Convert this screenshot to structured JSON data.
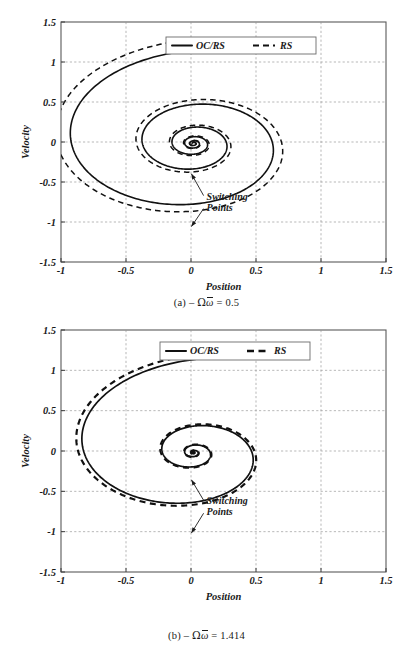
{
  "figure": {
    "panels": [
      {
        "id": "a",
        "caption_prefix": "(a)",
        "caption_minus": "–",
        "caption_omega_big": "Ω",
        "caption_omega_bar": "ω",
        "caption_eq": "=",
        "caption_value": "0.5",
        "xlabel": "Position",
        "ylabel": "Velocity",
        "annotation_line1": "Switching",
        "annotation_line2": "Points",
        "legend": [
          {
            "label": "OC/RS",
            "style": "solid"
          },
          {
            "label": "RS",
            "style": "dashed"
          }
        ],
        "xticks": [
          "-1",
          "-0.5",
          "0",
          "0.5",
          "1",
          "1.5"
        ],
        "yticks": [
          "1.5",
          "1",
          "0.5",
          "0",
          "-0.5",
          "-1",
          "-1.5"
        ]
      },
      {
        "id": "b",
        "caption_prefix": "(b)",
        "caption_minus": "–",
        "caption_omega_big": "Ω",
        "caption_omega_bar": "ω",
        "caption_eq": "=",
        "caption_value": "1.414",
        "xlabel": "Position",
        "ylabel": "Velocity",
        "annotation_line1": "Switching",
        "annotation_line2": "Points",
        "legend": [
          {
            "label": "OC/RS",
            "style": "solid"
          },
          {
            "label": "RS",
            "style": "dashed"
          }
        ],
        "xticks": [
          "-1",
          "-0.5",
          "0",
          "0.5",
          "1",
          "1.5"
        ],
        "yticks": [
          "1.5",
          "1",
          "0.5",
          "0",
          "-0.5",
          "-1",
          "-1.5"
        ]
      }
    ]
  },
  "chart_data": [
    {
      "type": "line",
      "title": "(a) – Ωω̄ = 0.5",
      "xlabel": "Position",
      "ylabel": "Velocity",
      "xlim": [
        -1,
        1.5
      ],
      "ylim": [
        -1.5,
        1.5
      ],
      "xticks": [
        -1,
        -0.5,
        0,
        0.5,
        1,
        1.5
      ],
      "yticks": [
        -1.5,
        -1,
        -0.5,
        0,
        0.5,
        1,
        1.5
      ],
      "grid": true,
      "legend_position": "top-center",
      "annotations": [
        {
          "text": "Switching Points",
          "x": 0.12,
          "y": -0.72
        }
      ],
      "series": [
        {
          "name": "OC/RS",
          "style": "solid",
          "description": "Decaying logarithmic spiral starting at (1,1), winding clockwise-inward to origin, decay factor approx 0.42 per half turn",
          "start": [
            1.0,
            1.0
          ],
          "end": [
            0.0,
            0.0
          ],
          "spiral": {
            "theta_start": 1.3734,
            "theta_end": 34.5,
            "r_start": 1.2,
            "decay_per_radian": 0.1385,
            "center": [
              0.0,
              0.0
            ],
            "x_offset": 0.02,
            "y_offset": -0.02
          },
          "switching_points": [
            [
              -0.02,
              -0.36
            ],
            [
              -0.02,
              -1.02
            ]
          ]
        },
        {
          "name": "RS",
          "style": "dashed",
          "description": "Decaying spiral, slightly larger radius than OC/RS, starting at (1,1)",
          "start": [
            1.0,
            1.0
          ],
          "end": [
            0.0,
            0.0
          ],
          "spiral": {
            "theta_start": 1.3734,
            "theta_end": 34.5,
            "r_start": 1.34,
            "decay_per_radian": 0.1385,
            "center": [
              0.0,
              0.0
            ],
            "x_offset": 0.02,
            "y_offset": -0.02
          }
        }
      ]
    },
    {
      "type": "line",
      "title": "(b) – Ωω̄ = 1.414",
      "xlabel": "Position",
      "ylabel": "Velocity",
      "xlim": [
        -1,
        1.5
      ],
      "ylim": [
        -1.5,
        1.5
      ],
      "xticks": [
        -1,
        -0.5,
        0,
        0.5,
        1,
        1.5
      ],
      "yticks": [
        -1.5,
        -1,
        -0.5,
        0,
        0.5,
        1,
        1.5
      ],
      "grid": true,
      "legend_position": "top-center",
      "annotations": [
        {
          "text": "Switching Points",
          "x": 0.12,
          "y": -0.66
        }
      ],
      "series": [
        {
          "name": "OC/RS",
          "style": "solid",
          "description": "Faster decaying spiral starting at (1,1), decay factor approx 0.33 per half turn, nearly coincident with RS",
          "start": [
            1.0,
            1.0
          ],
          "end": [
            0.0,
            0.0
          ],
          "spiral": {
            "theta_start": 1.3734,
            "theta_end": 34.5,
            "r_start": 1.2,
            "decay_per_radian": 0.2,
            "center": [
              0.0,
              0.0
            ],
            "x_offset": 0.02,
            "y_offset": -0.02
          },
          "switching_points": [
            [
              -0.02,
              -0.32
            ],
            [
              -0.02,
              -0.98
            ]
          ]
        },
        {
          "name": "RS",
          "style": "dashed",
          "description": "Faster decaying spiral, marginally larger than OC/RS, nearly coincident",
          "start": [
            1.0,
            1.0
          ],
          "end": [
            0.0,
            0.0
          ],
          "spiral": {
            "theta_start": 1.3734,
            "theta_end": 34.5,
            "r_start": 1.26,
            "decay_per_radian": 0.2,
            "center": [
              0.0,
              0.0
            ],
            "x_offset": 0.02,
            "y_offset": -0.02
          }
        }
      ]
    }
  ]
}
